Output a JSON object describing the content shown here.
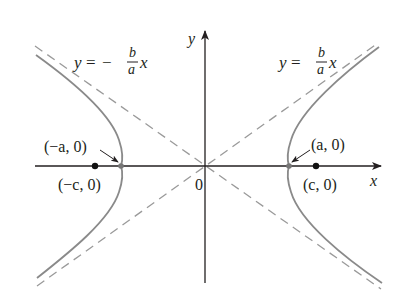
{
  "figure": {
    "axes": {
      "x_label": "x",
      "y_label": "y",
      "origin_label": "0"
    },
    "asymptotes": {
      "negative": {
        "lhs": "y",
        "eq": "=",
        "sign": "−",
        "num": "b",
        "den": "a",
        "var": "x"
      },
      "positive": {
        "lhs": "y",
        "eq": "=",
        "sign": "",
        "num": "b",
        "den": "a",
        "var": "x"
      }
    },
    "points": {
      "left_vertex": "(−a, 0)",
      "right_vertex": "(a, 0)",
      "left_focus": "(−c, 0)",
      "right_focus": "(c, 0)"
    },
    "colors": {
      "axis": "#231f20",
      "curve": "#8a8a8a",
      "asymptote": "#9a9a9a",
      "focus_dot": "#111111",
      "vertex_dot": "#777777"
    }
  }
}
